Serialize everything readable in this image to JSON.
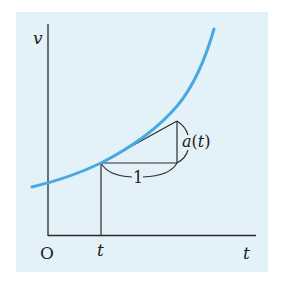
{
  "diagram": {
    "type": "tangent-line-derivative-illustration",
    "axes": {
      "y_label": "v",
      "x_label": "t",
      "origin_label": "O",
      "tick_label": "t"
    },
    "curve": {
      "description": "increasing convex curve v(t)",
      "color": "#4aa8e0"
    },
    "slope_triangle": {
      "run_label": "1",
      "rise_label": "a(t)",
      "rise_label_parts": {
        "fn": "a",
        "open": "(",
        "arg": "t",
        "close": ")"
      }
    },
    "colors": {
      "panel_background": "#e3f2f8",
      "lines": "#2a2a2a",
      "curve": "#4aa8e0"
    }
  }
}
